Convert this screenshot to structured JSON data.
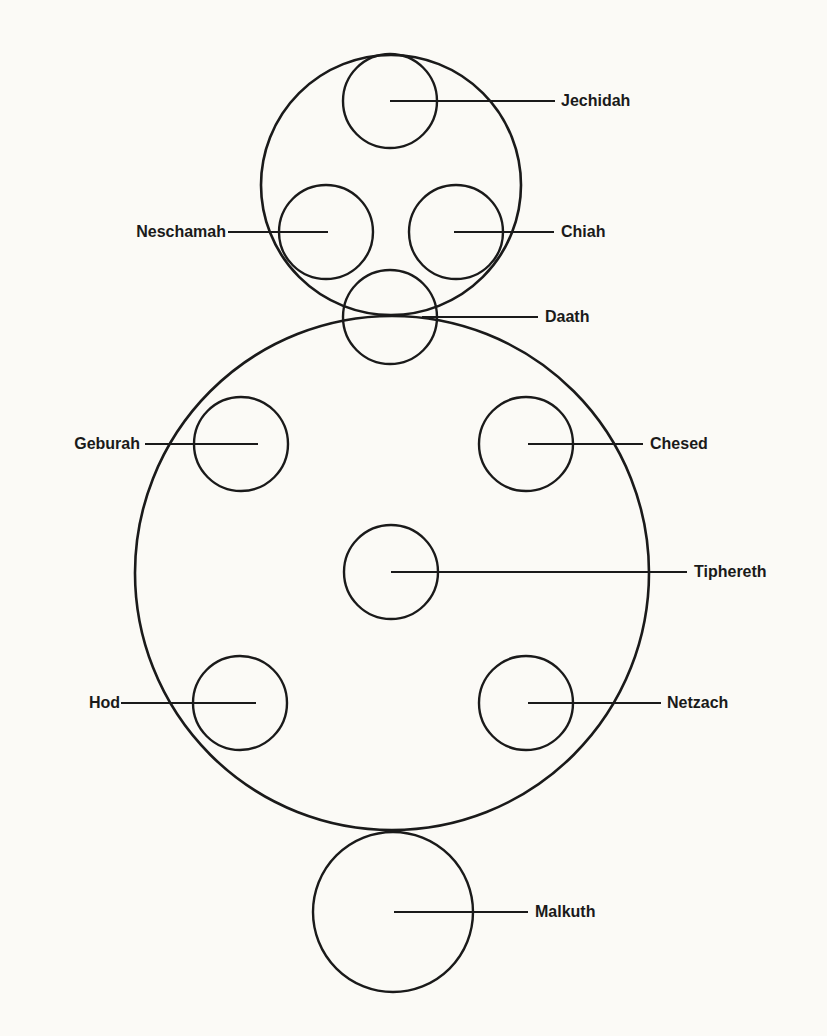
{
  "diagram": {
    "stroke_color": "#1a1a1a",
    "background": "#fbfaf6",
    "containers": [
      {
        "name": "upper-circle",
        "cx": 391,
        "cy": 185,
        "r": 130
      },
      {
        "name": "lower-circle",
        "cx": 392,
        "cy": 573,
        "r": 257
      }
    ],
    "nodes": [
      {
        "id": "jechidah",
        "label": "Jechidah",
        "cx": 390,
        "cy": 101,
        "r": 47,
        "line_from_x": 390,
        "line_to_x": 555,
        "side": "right",
        "label_x": 561
      },
      {
        "id": "neschamah",
        "label": "Neschamah",
        "cx": 326,
        "cy": 232,
        "r": 47,
        "line_from_x": 328,
        "line_to_x": 228,
        "side": "left",
        "label_x": 226
      },
      {
        "id": "chiah",
        "label": "Chiah",
        "cx": 456,
        "cy": 232,
        "r": 47,
        "line_from_x": 454,
        "line_to_x": 554,
        "side": "right",
        "label_x": 561
      },
      {
        "id": "daath",
        "label": "Daath",
        "cx": 390,
        "cy": 317,
        "r": 47,
        "line_from_x": 422,
        "line_to_x": 538,
        "side": "right",
        "label_x": 545
      },
      {
        "id": "geburah",
        "label": "Geburah",
        "cx": 241,
        "cy": 444,
        "r": 47,
        "line_from_x": 258,
        "line_to_x": 145,
        "side": "left",
        "label_x": 140
      },
      {
        "id": "chesed",
        "label": "Chesed",
        "cx": 526,
        "cy": 444,
        "r": 47,
        "line_from_x": 528,
        "line_to_x": 643,
        "side": "right",
        "label_x": 650
      },
      {
        "id": "tiphereth",
        "label": "Tiphereth",
        "cx": 391,
        "cy": 572,
        "r": 47,
        "line_from_x": 391,
        "line_to_x": 687,
        "side": "right",
        "label_x": 694
      },
      {
        "id": "hod",
        "label": "Hod",
        "cx": 240,
        "cy": 703,
        "r": 47,
        "line_from_x": 256,
        "line_to_x": 121,
        "side": "left",
        "label_x": 120
      },
      {
        "id": "netzach",
        "label": "Netzach",
        "cx": 526,
        "cy": 703,
        "r": 47,
        "line_from_x": 528,
        "line_to_x": 661,
        "side": "right",
        "label_x": 667
      },
      {
        "id": "malkuth",
        "label": "Malkuth",
        "cx": 393,
        "cy": 912,
        "r": 80,
        "line_from_x": 394,
        "line_to_x": 528,
        "side": "right",
        "label_x": 535
      }
    ]
  }
}
